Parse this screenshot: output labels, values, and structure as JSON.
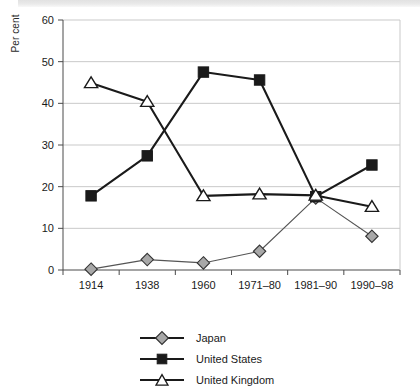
{
  "chart_data": {
    "type": "line",
    "title": "",
    "subtitle": "",
    "xlabel": "",
    "ylabel": "Per cent",
    "categories": [
      "1914",
      "1938",
      "1960",
      "1971–80",
      "1981–90",
      "1990–98"
    ],
    "ylim": [
      0,
      60
    ],
    "ytick_values": [
      0,
      10,
      20,
      30,
      40,
      50,
      60
    ],
    "ytick_labels": [
      "0",
      "10",
      "20",
      "30",
      "40",
      "50",
      "60"
    ],
    "grid": "horizontal",
    "legend_position": "bottom-center",
    "series": [
      {
        "name": "Japan",
        "marker": "diamond",
        "marker_fill": "#a8a8a8",
        "marker_stroke": "#333333",
        "line_color": "#555555",
        "values": [
          0.2,
          2.5,
          1.7,
          4.5,
          17.3,
          8.1
        ]
      },
      {
        "name": "United States",
        "marker": "square",
        "marker_fill": "#1a1a1a",
        "marker_stroke": "#1a1a1a",
        "line_color": "#1a1a1a",
        "values": [
          17.8,
          27.4,
          47.5,
          45.6,
          17.6,
          25.2
        ]
      },
      {
        "name": "United Kingdom",
        "marker": "triangle",
        "marker_fill": "#ffffff",
        "marker_stroke": "#1a1a1a",
        "line_color": "#1a1a1a",
        "values": [
          44.9,
          40.4,
          17.8,
          18.2,
          17.9,
          15.2
        ]
      }
    ]
  },
  "axis": {
    "y_title": "Per cent"
  },
  "legend": {
    "items": [
      {
        "label": "Japan"
      },
      {
        "label": "United States"
      },
      {
        "label": "United Kingdom"
      }
    ]
  }
}
